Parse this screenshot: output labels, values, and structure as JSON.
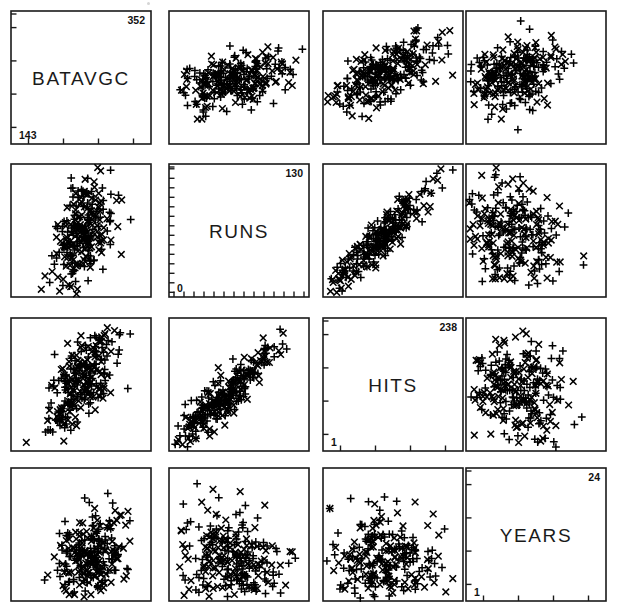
{
  "figure": {
    "type": "scatterplot-matrix",
    "variables": [
      "BATAVGC",
      "RUNS",
      "HITS",
      "YEARS"
    ],
    "n_rows": 4,
    "n_cols": 4,
    "background_color": "#ffffff",
    "ink_color": "#000000",
    "marker_glyphs": [
      "plus",
      "cross"
    ],
    "panel_geometry": {
      "col_x": [
        10,
        168,
        322,
        465
      ],
      "row_y": [
        10,
        163,
        317,
        467
      ],
      "panel_width": 142,
      "panel_height": 135
    }
  },
  "chart_data": {
    "type": "scatter",
    "title": "",
    "xlabel": "",
    "ylabel": "",
    "grid": false,
    "legend": "none",
    "matrix_variables": [
      "BATAVGC",
      "RUNS",
      "HITS",
      "YEARS"
    ],
    "diagonal_panels": [
      {
        "row": 0,
        "col": 0,
        "variable": "BATAVGC",
        "label": "BATAVGC",
        "min": "143",
        "max": "352",
        "min_value": 143,
        "max_value": 352,
        "tick_count": 4
      },
      {
        "row": 1,
        "col": 1,
        "variable": "RUNS",
        "label": "RUNS",
        "min": "0",
        "max": "130",
        "min_value": 0,
        "max_value": 130,
        "tick_count": 14
      },
      {
        "row": 2,
        "col": 2,
        "variable": "HITS",
        "label": "HITS",
        "min": "1",
        "max": "238",
        "min_value": 1,
        "max_value": 238,
        "tick_count": 4
      },
      {
        "row": 3,
        "col": 3,
        "variable": "YEARS",
        "label": "YEARS",
        "min": "1",
        "max": "24",
        "min_value": 1,
        "max_value": 24,
        "tick_count": 4
      }
    ],
    "scatter_panels": [
      {
        "row": 0,
        "col": 1,
        "x_variable": "RUNS",
        "y_variable": "BATAVGC",
        "relationship": "moderate positive",
        "n_points": 263,
        "cluster": {
          "cx": 0.47,
          "cy": 0.5,
          "sx": 0.2,
          "sy": 0.11,
          "rho": 0.42
        }
      },
      {
        "row": 0,
        "col": 2,
        "x_variable": "HITS",
        "y_variable": "BATAVGC",
        "relationship": "strong positive",
        "n_points": 263,
        "cluster": {
          "cx": 0.42,
          "cy": 0.52,
          "sx": 0.19,
          "sy": 0.13,
          "rho": 0.62
        }
      },
      {
        "row": 0,
        "col": 3,
        "x_variable": "YEARS",
        "y_variable": "BATAVGC",
        "relationship": "weak positive",
        "n_points": 263,
        "cluster": {
          "cx": 0.33,
          "cy": 0.52,
          "sx": 0.17,
          "sy": 0.14,
          "rho": 0.18
        }
      },
      {
        "row": 1,
        "col": 0,
        "x_variable": "BATAVGC",
        "y_variable": "RUNS",
        "relationship": "moderate positive",
        "n_points": 263,
        "cluster": {
          "cx": 0.52,
          "cy": 0.5,
          "sx": 0.11,
          "sy": 0.21,
          "rho": 0.42
        }
      },
      {
        "row": 1,
        "col": 2,
        "x_variable": "HITS",
        "y_variable": "RUNS",
        "relationship": "very strong positive",
        "n_points": 263,
        "cluster": {
          "cx": 0.42,
          "cy": 0.45,
          "sx": 0.2,
          "sy": 0.21,
          "rho": 0.92
        }
      },
      {
        "row": 1,
        "col": 3,
        "x_variable": "YEARS",
        "y_variable": "RUNS",
        "relationship": "weak negative",
        "n_points": 263,
        "cluster": {
          "cx": 0.33,
          "cy": 0.47,
          "sx": 0.19,
          "sy": 0.22,
          "rho": -0.24
        }
      },
      {
        "row": 2,
        "col": 0,
        "x_variable": "BATAVGC",
        "y_variable": "HITS",
        "relationship": "strong positive",
        "n_points": 263,
        "cluster": {
          "cx": 0.5,
          "cy": 0.5,
          "sx": 0.12,
          "sy": 0.2,
          "rho": 0.62
        }
      },
      {
        "row": 2,
        "col": 1,
        "x_variable": "RUNS",
        "y_variable": "HITS",
        "relationship": "very strong positive",
        "n_points": 263,
        "cluster": {
          "cx": 0.42,
          "cy": 0.44,
          "sx": 0.2,
          "sy": 0.21,
          "rho": 0.92
        }
      },
      {
        "row": 2,
        "col": 3,
        "x_variable": "YEARS",
        "y_variable": "HITS",
        "relationship": "weak negative",
        "n_points": 263,
        "cluster": {
          "cx": 0.33,
          "cy": 0.46,
          "sx": 0.19,
          "sy": 0.22,
          "rho": -0.22
        }
      },
      {
        "row": 3,
        "col": 0,
        "x_variable": "BATAVGC",
        "y_variable": "YEARS",
        "relationship": "weak positive",
        "n_points": 263,
        "cluster": {
          "cx": 0.55,
          "cy": 0.31,
          "sx": 0.13,
          "sy": 0.18,
          "rho": 0.18
        }
      },
      {
        "row": 3,
        "col": 1,
        "x_variable": "RUNS",
        "y_variable": "YEARS",
        "relationship": "weak negative",
        "n_points": 263,
        "cluster": {
          "cx": 0.45,
          "cy": 0.3,
          "sx": 0.22,
          "sy": 0.2,
          "rho": -0.24
        }
      },
      {
        "row": 3,
        "col": 2,
        "x_variable": "HITS",
        "y_variable": "YEARS",
        "relationship": "weak negative",
        "n_points": 263,
        "cluster": {
          "cx": 0.42,
          "cy": 0.3,
          "sx": 0.21,
          "sy": 0.2,
          "rho": -0.22
        }
      }
    ]
  }
}
